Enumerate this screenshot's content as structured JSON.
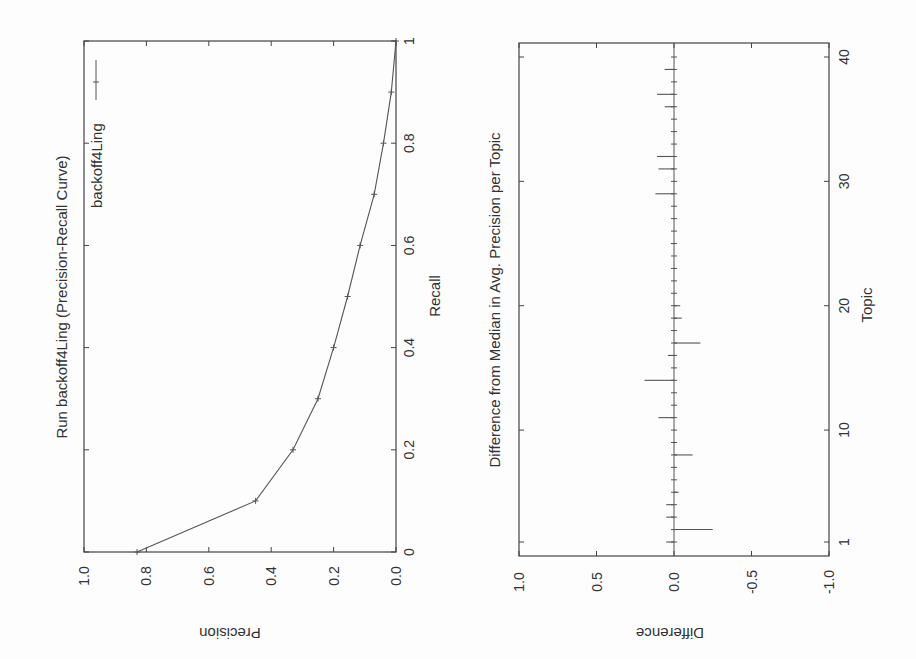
{
  "chart_data": [
    {
      "type": "line",
      "title": "Run backoff4Ling (Precision-Recall Curve)",
      "xlabel": "Recall",
      "ylabel": "Precision",
      "xlim": [
        0,
        1
      ],
      "ylim": [
        0.0,
        1.0
      ],
      "x_ticks": [
        "0",
        "0.2",
        "0.4",
        "0.6",
        "0.8",
        "1"
      ],
      "y_ticks": [
        "0.0",
        "0.2",
        "0.4",
        "0.6",
        "0.8",
        "1.0"
      ],
      "legend": {
        "entries": [
          "backoff4Ling"
        ],
        "position": "upper right"
      },
      "grid": false,
      "orientation": "rotated 90 degrees counterclockwise",
      "series": [
        {
          "name": "backoff4Ling",
          "x": [
            0.0,
            0.1,
            0.2,
            0.3,
            0.4,
            0.5,
            0.6,
            0.7,
            0.8,
            0.9,
            1.0
          ],
          "values": [
            0.83,
            0.45,
            0.33,
            0.25,
            0.2,
            0.155,
            0.115,
            0.07,
            0.04,
            0.015,
            0.0
          ]
        }
      ]
    },
    {
      "type": "bar",
      "title": "Difference from Median in Avg. Precision per Topic",
      "xlabel": "Topic",
      "ylabel": "Difference",
      "xlim": [
        1,
        40
      ],
      "ylim": [
        -1.0,
        1.0
      ],
      "x_ticks": [
        "1",
        "10",
        "20",
        "30",
        "40"
      ],
      "y_ticks": [
        "1.0",
        "0.5",
        "0.0",
        "-0.5",
        "-1.0"
      ],
      "grid": false,
      "orientation": "rotated 90 degrees counterclockwise",
      "categories": [
        1,
        2,
        3,
        4,
        5,
        6,
        7,
        8,
        9,
        10,
        11,
        12,
        13,
        14,
        15,
        16,
        17,
        18,
        19,
        20,
        21,
        22,
        23,
        24,
        25,
        26,
        27,
        28,
        29,
        30,
        31,
        32,
        33,
        34,
        35,
        36,
        37,
        38,
        39,
        40
      ],
      "values": [
        0.05,
        -0.25,
        0.05,
        0.05,
        -0.03,
        0.0,
        0.0,
        -0.12,
        0.0,
        0.0,
        0.1,
        0.0,
        0.0,
        0.19,
        0.0,
        0.04,
        -0.17,
        0.0,
        -0.05,
        -0.04,
        0.0,
        0.0,
        0.0,
        0.0,
        0.02,
        0.0,
        0.0,
        0.0,
        0.12,
        0.0,
        0.1,
        0.11,
        0.0,
        0.0,
        0.0,
        0.06,
        0.11,
        0.0,
        0.06,
        0.0
      ]
    }
  ],
  "charts": {
    "pr": {
      "title": "Run backoff4Ling (Precision-Recall Curve)",
      "xlabel": "Recall",
      "ylabel": "Precision",
      "legend_label": "backoff4Ling"
    },
    "diff": {
      "title": "Difference from Median in Avg. Precision per Topic",
      "xlabel": "Topic",
      "ylabel": "Difference"
    }
  },
  "colors": {
    "line": "#555555",
    "frame": "#444444",
    "text": "#333333"
  }
}
